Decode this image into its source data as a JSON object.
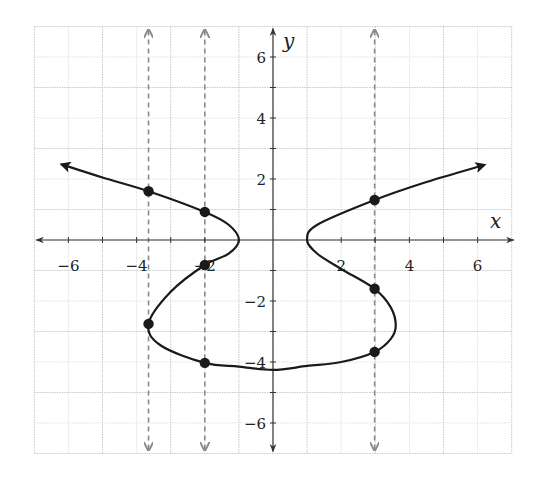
{
  "chart_data": {
    "type": "line",
    "title": "",
    "xlabel": "x",
    "ylabel": "y",
    "xlim": [
      -7,
      7
    ],
    "ylim": [
      -7,
      7
    ],
    "grid": true,
    "grid_major_step": 2,
    "grid_minor_step": 1,
    "x_ticks": [
      -6,
      -4,
      -2,
      2,
      4,
      6
    ],
    "y_ticks": [
      -6,
      -4,
      -2,
      2,
      4,
      6
    ],
    "x_tick_labels": [
      "−6",
      "−4",
      "−2",
      "2",
      "4",
      "6"
    ],
    "y_tick_labels": [
      "−6",
      "−4",
      "−2",
      "2",
      "4",
      "6"
    ],
    "series": [
      {
        "name": "curve",
        "style": "solid",
        "color": "#1a1a1a",
        "arrow_start": true,
        "arrow_end": true,
        "x": [
          -6.2,
          -5.0,
          -3.65,
          -2.0,
          -1.3,
          -1.0,
          -1.3,
          -2.0,
          -3.0,
          -3.65,
          -3.3,
          -2.0,
          -1.0,
          0.0,
          1.0,
          2.0,
          2.98,
          3.45,
          3.6,
          3.45,
          2.98,
          2.0,
          1.3,
          1.0,
          1.3,
          2.98,
          4.5,
          6.2
        ],
        "y": [
          2.48,
          2.05,
          1.6,
          0.92,
          0.5,
          0.0,
          -0.45,
          -0.82,
          -1.7,
          -2.75,
          -3.45,
          -4.03,
          -4.15,
          -4.26,
          -4.13,
          -4.0,
          -3.67,
          -3.25,
          -2.8,
          -2.2,
          -1.6,
          -0.95,
          -0.45,
          0.0,
          0.5,
          1.31,
          1.9,
          2.46
        ]
      }
    ],
    "points": [
      {
        "x": -3.65,
        "y": 1.6
      },
      {
        "x": -2.0,
        "y": 0.92
      },
      {
        "x": -2.0,
        "y": -0.82
      },
      {
        "x": -3.65,
        "y": -2.75
      },
      {
        "x": -2.0,
        "y": -4.03
      },
      {
        "x": 2.98,
        "y": 1.31
      },
      {
        "x": 2.98,
        "y": -1.6
      },
      {
        "x": 2.98,
        "y": -3.67
      }
    ],
    "vertical_lines": [
      {
        "x": -3.65,
        "style": "dashed",
        "color": "#8a8a8a",
        "arrows": "both"
      },
      {
        "x": -2.0,
        "style": "dashed",
        "color": "#8a8a8a",
        "arrows": "both"
      },
      {
        "x": 2.98,
        "style": "dashed",
        "color": "#8a8a8a",
        "arrows": "both"
      }
    ],
    "legend": null
  },
  "colors": {
    "background": "#ffffff",
    "grid_major": "#c8c8c8",
    "grid_minor": "#e2e2e2",
    "axis": "#333333",
    "curve": "#1a1a1a",
    "dashed": "#8a8a8a"
  }
}
